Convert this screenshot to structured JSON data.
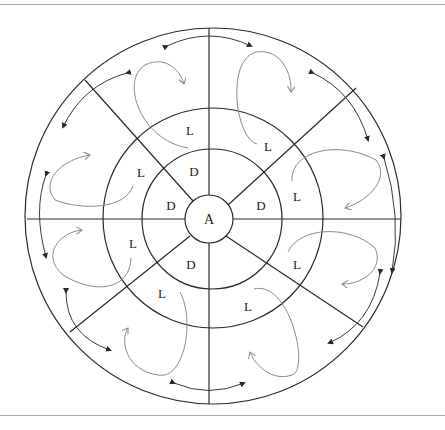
{
  "diagram": {
    "center_label": "A",
    "rings": [
      {
        "name": "inner",
        "label": "A"
      },
      {
        "name": "dark-ring",
        "label": "D"
      },
      {
        "name": "light-ring",
        "label": "L"
      },
      {
        "name": "outer-ring",
        "label": ""
      }
    ],
    "labels": {
      "A": "A",
      "d1": "D",
      "d2": "D",
      "d3": "D",
      "d4": "D",
      "l1": "L",
      "l2": "L",
      "l3": "L",
      "l4": "L",
      "l5": "L",
      "l6": "L",
      "l7": "L",
      "l8": "L"
    },
    "colors": {
      "line": "#2a2a2a",
      "loop_arrow": "#8a8a8a",
      "rim_arrow": "#3a3a3a",
      "rule": "#a8a8a8"
    }
  }
}
